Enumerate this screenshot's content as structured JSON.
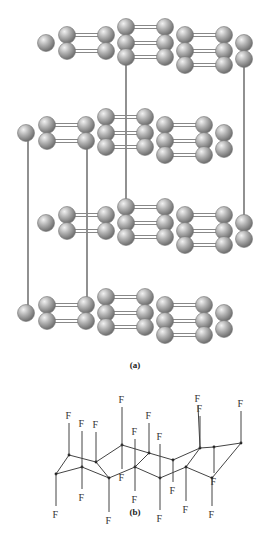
{
  "figure": {
    "panel_a": {
      "label": "(a)",
      "description": "Crystal structure: four stacked layers of atom chains shown as gray spheres, connected by vertical unit-cell lines",
      "sphere_color": "#a8a8a8",
      "line_color": "#555555",
      "layer_count": 4
    },
    "panel_b": {
      "label": "(b)",
      "description": "Helical fluorocarbon chain with F atoms on every carbon",
      "atom_label": "F",
      "f_count": 20
    }
  }
}
